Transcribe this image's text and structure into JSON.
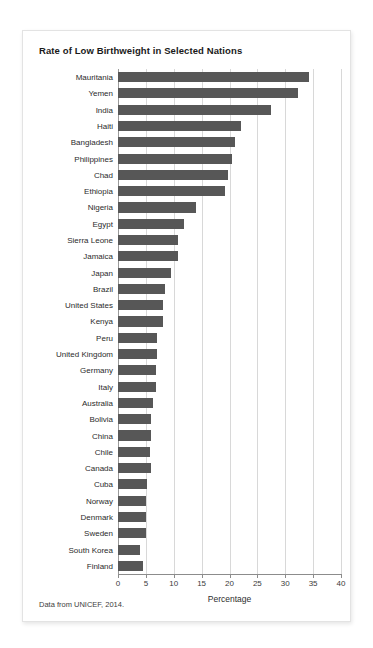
{
  "card": {
    "title": "Rate of Low Birthweight in Selected Nations",
    "source_note": "Data from UNICEF, 2014."
  },
  "colors": {
    "bar": "#575757",
    "grid": "#d8d8d8",
    "axis": "#8c8c8c",
    "card_background": "#ffffff",
    "page_background": "#ffffff",
    "text": "#2b2b2b"
  },
  "chart_data": {
    "type": "bar",
    "orientation": "horizontal",
    "title": "Rate of Low Birthweight in Selected Nations",
    "xlabel": "Percentage",
    "ylabel": "",
    "xlim": [
      0,
      40
    ],
    "xticks": [
      0,
      5,
      10,
      15,
      20,
      25,
      30,
      35,
      40
    ],
    "xtick_labels": [
      "0",
      "5",
      "10",
      "15",
      "20",
      "25",
      "30",
      "35",
      "40"
    ],
    "grid": true,
    "legend": false,
    "source": "Data from UNICEF, 2014.",
    "categories": [
      "Mauritania",
      "Yemen",
      "India",
      "Haiti",
      "Bangladesh",
      "Philippines",
      "Chad",
      "Ethiopia",
      "Nigeria",
      "Egypt",
      "Sierra Leone",
      "Jamaica",
      "Japan",
      "Brazil",
      "United States",
      "Kenya",
      "Peru",
      "United Kingdom",
      "Germany",
      "Italy",
      "Australia",
      "Bolivia",
      "China",
      "Chile",
      "Canada",
      "Cuba",
      "Norway",
      "Denmark",
      "Sweden",
      "South Korea",
      "Finland"
    ],
    "values": [
      34.3,
      32.3,
      27.5,
      22.0,
      21.0,
      20.5,
      19.7,
      19.2,
      14.0,
      11.8,
      10.7,
      10.7,
      9.5,
      8.5,
      8.0,
      8.0,
      7.0,
      7.0,
      6.8,
      6.8,
      6.2,
      6.0,
      5.9,
      5.8,
      6.0,
      5.2,
      5.0,
      5.0,
      5.0,
      4.0,
      4.4
    ]
  }
}
